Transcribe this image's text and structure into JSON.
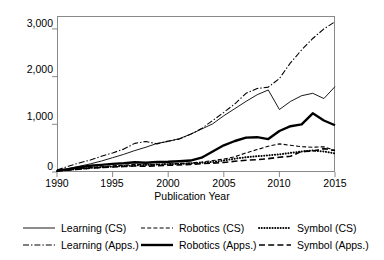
{
  "chart_data": {
    "type": "line",
    "title": "",
    "xlabel": "Publication Year",
    "ylabel": "",
    "xlim": [
      1990,
      2015
    ],
    "ylim": [
      0,
      3250
    ],
    "grid": false,
    "legend_position": "bottom",
    "x": [
      1990,
      1991,
      1992,
      1993,
      1994,
      1995,
      1996,
      1997,
      1998,
      1999,
      2000,
      2001,
      2002,
      2003,
      2004,
      2005,
      2006,
      2007,
      2008,
      2009,
      2010,
      2011,
      2012,
      2013,
      2014,
      2015
    ],
    "xticks": [
      "1990",
      "1995",
      "2000",
      "2005",
      "2010",
      "2015"
    ],
    "yticks": [
      "0",
      "1,000",
      "2,000",
      "3,000"
    ],
    "ytick_values": [
      0,
      1000,
      2000,
      3000
    ],
    "series": [
      {
        "name": "Learning (CS)",
        "style": "solid-thin",
        "values": [
          30,
          70,
          120,
          170,
          230,
          300,
          370,
          450,
          520,
          600,
          640,
          700,
          790,
          900,
          1010,
          1180,
          1330,
          1480,
          1620,
          1720,
          1310,
          1480,
          1600,
          1650,
          1540,
          1790
        ]
      },
      {
        "name": "Learning (Apps.)",
        "style": "dash-dot",
        "values": [
          40,
          120,
          190,
          250,
          330,
          400,
          480,
          600,
          640,
          590,
          650,
          690,
          790,
          910,
          1080,
          1250,
          1430,
          1650,
          1750,
          1780,
          1960,
          2290,
          2560,
          2800,
          3000,
          3150
        ]
      },
      {
        "name": "Robotics (CS)",
        "style": "dashed",
        "values": [
          25,
          45,
          70,
          95,
          110,
          130,
          140,
          160,
          150,
          160,
          170,
          180,
          190,
          210,
          240,
          270,
          320,
          400,
          470,
          540,
          590,
          560,
          530,
          520,
          530,
          450
        ]
      },
      {
        "name": "Robotics (Apps.)",
        "style": "solid-thick",
        "values": [
          30,
          60,
          100,
          130,
          150,
          170,
          185,
          205,
          195,
          210,
          215,
          225,
          240,
          300,
          430,
          560,
          650,
          720,
          730,
          690,
          860,
          960,
          1000,
          1230,
          1080,
          980
        ]
      },
      {
        "name": "Symbol (CS)",
        "style": "dotted",
        "values": [
          20,
          45,
          65,
          85,
          100,
          115,
          125,
          140,
          150,
          155,
          165,
          170,
          180,
          195,
          210,
          240,
          280,
          310,
          330,
          350,
          370,
          400,
          430,
          450,
          430,
          390
        ]
      },
      {
        "name": "Symbol (Apps.)",
        "style": "long-dash",
        "values": [
          20,
          40,
          60,
          80,
          95,
          105,
          115,
          125,
          120,
          130,
          140,
          150,
          160,
          175,
          185,
          200,
          225,
          245,
          260,
          280,
          310,
          330,
          430,
          440,
          490,
          450
        ]
      }
    ]
  },
  "legend": {
    "entries": [
      {
        "label": "Learning (CS)",
        "style": "solid-thin"
      },
      {
        "label": "Robotics (CS)",
        "style": "dashed"
      },
      {
        "label": "Symbol (CS)",
        "style": "dotted"
      },
      {
        "label": "Learning (Apps.)",
        "style": "dash-dot"
      },
      {
        "label": "Robotics (Apps.)",
        "style": "solid-thick"
      },
      {
        "label": "Symbol (Apps.)",
        "style": "long-dash"
      }
    ]
  },
  "colors": {
    "line": "#000000",
    "axis": "#8a8a8a",
    "background": "#ffffff"
  }
}
